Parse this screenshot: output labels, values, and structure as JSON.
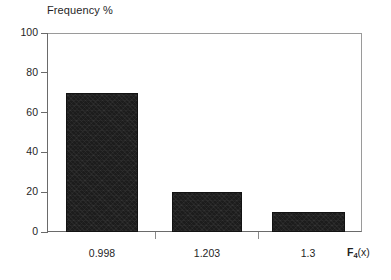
{
  "chart_data": {
    "type": "bar",
    "title": "Frequency %",
    "xlabel": "F4(x)",
    "xlabel_base": "F",
    "xlabel_sub": "4",
    "xlabel_arg": "(x)",
    "ylabel": "",
    "categories": [
      "0.998",
      "1.203",
      "1.3"
    ],
    "values": [
      70,
      20,
      10
    ],
    "ylim": [
      0,
      100
    ],
    "yticks": [
      0,
      20,
      40,
      60,
      80,
      100
    ],
    "ytick_labels": [
      "0",
      "20",
      "40",
      "60",
      "80",
      "100"
    ],
    "grid": false,
    "legend": null,
    "bar_color": "#1c1c1c",
    "frame_color": "#6a6a6a",
    "background": "#ffffff"
  },
  "bars": [
    {
      "label": "0.998",
      "value": 70,
      "left": 18,
      "width": 72,
      "center": 54
    },
    {
      "label": "1.203",
      "value": 20,
      "left": 124,
      "width": 70,
      "center": 159
    },
    {
      "label": "1.3",
      "value": 10,
      "left": 224,
      "width": 73,
      "center": 260
    }
  ],
  "x_ticks": [
    107,
    210
  ],
  "y_axis": {
    "ticks": [
      {
        "label": "100",
        "value": 100
      },
      {
        "label": "80",
        "value": 80
      },
      {
        "label": "60",
        "value": 60
      },
      {
        "label": "40",
        "value": 40
      },
      {
        "label": "20",
        "value": 20
      },
      {
        "label": "0",
        "value": 0
      }
    ]
  }
}
